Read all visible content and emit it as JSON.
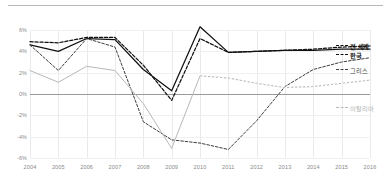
{
  "chart_data": {
    "type": "line",
    "title": "",
    "xlabel": "",
    "ylabel": "",
    "x": [
      2004,
      2005,
      2006,
      2007,
      2008,
      2009,
      2010,
      2011,
      2012,
      2013,
      2014,
      2015,
      2016
    ],
    "xticklabels": [
      "2004",
      "2005",
      "2006",
      "2007",
      "2008",
      "2009",
      "2010",
      "2011",
      "2012",
      "2013",
      "2014",
      "2015",
      "2016"
    ],
    "yticklabels": [
      "6%",
      "4%",
      "2%",
      "0%",
      "-2%",
      "-4%",
      "-6%"
    ],
    "ytickvalues": [
      6,
      4,
      2,
      0,
      -2,
      -4,
      -6
    ],
    "ylim": [
      -6,
      6
    ],
    "xlim": [
      2004,
      2016
    ],
    "grid": true,
    "legend_position": "right",
    "series": [
      {
        "name": "전 세계",
        "style": "dashed",
        "color": "#111111",
        "emphasis": "bold",
        "values": [
          4.9,
          4.8,
          5.3,
          5.3,
          2.7,
          -0.6,
          5.2,
          3.9,
          4.0,
          4.1,
          4.2,
          4.4,
          4.5
        ]
      },
      {
        "name": "한국",
        "style": "solid",
        "color": "#111111",
        "emphasis": "bold",
        "values": [
          4.6,
          4.0,
          5.2,
          5.1,
          2.3,
          0.3,
          6.3,
          3.9,
          4.0,
          4.1,
          4.1,
          4.2,
          4.2
        ]
      },
      {
        "name": "그리스",
        "style": "dashed",
        "color": "#3d3d3d",
        "emphasis": "normal",
        "values": [
          4.6,
          2.2,
          5.2,
          4.4,
          -2.6,
          -4.3,
          -4.6,
          -5.2,
          -2.5,
          0.7,
          2.3,
          3.0,
          3.4
        ]
      },
      {
        "name": "이탈리아",
        "style": "light",
        "color": "#b8b8b8",
        "emphasis": "normal",
        "values": [
          2.2,
          1.1,
          2.6,
          2.2,
          -0.9,
          -5.1,
          1.7,
          1.5,
          1.0,
          0.6,
          0.7,
          1.0,
          1.3
        ]
      }
    ]
  },
  "legend": {
    "items": [
      {
        "label": "전 세계"
      },
      {
        "label": "한국"
      },
      {
        "label": "그리스"
      },
      {
        "label": "이탈리아"
      }
    ]
  },
  "colors": {
    "world": "#111111",
    "korea": "#111111",
    "greece": "#3d3d3d",
    "italy": "#b8b8b8",
    "grid": "#f0f0f0",
    "axis": "#c8c8c8",
    "zero": "#9a9a9a",
    "tick_text": "#8a8a8a"
  }
}
